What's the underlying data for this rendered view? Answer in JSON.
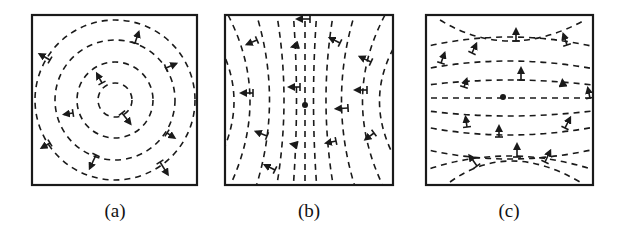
{
  "figure": {
    "colors": {
      "stroke": "#1a1a1a",
      "background": "#ffffff"
    },
    "panels": [
      {
        "id": "a",
        "label": "(a)",
        "pattern": "concentric-circles",
        "box": {
          "x": 32,
          "y": 15,
          "w": 165,
          "h": 170
        },
        "center": [
          115,
          100
        ],
        "circle_radii": [
          17,
          38,
          60,
          80
        ],
        "arrows": [
          {
            "from": [
              102,
              83
            ],
            "to": [
              95,
              70
            ]
          },
          {
            "from": [
              122,
              113
            ],
            "to": [
              133,
              127
            ]
          },
          {
            "from": [
              73,
              113
            ],
            "to": [
              60,
              115
            ]
          },
          {
            "from": [
              96,
              155
            ],
            "to": [
              88,
              172
            ]
          },
          {
            "from": [
              167,
              133
            ],
            "to": [
              178,
              140
            ]
          },
          {
            "from": [
              166,
              68
            ],
            "to": [
              180,
              62
            ]
          },
          {
            "from": [
              135,
              43
            ],
            "to": [
              140,
              28
            ]
          },
          {
            "from": [
              50,
              60
            ],
            "to": [
              36,
              52
            ]
          },
          {
            "from": [
              50,
              143
            ],
            "to": [
              38,
              150
            ]
          },
          {
            "from": [
              160,
              162
            ],
            "to": [
              170,
              178
            ]
          }
        ]
      },
      {
        "id": "b",
        "label": "(b)",
        "pattern": "vertical-hyperbolic",
        "box": {
          "x": 225,
          "y": 15,
          "w": 168,
          "h": 170
        },
        "center": [
          305,
          105
        ],
        "arrows": [
          {
            "from": [
              310,
              19
            ],
            "to": [
              293,
              19
            ]
          },
          {
            "from": [
              257,
              40
            ],
            "to": [
              243,
              46
            ]
          },
          {
            "from": [
              298,
              45
            ],
            "to": [
              288,
              48
            ]
          },
          {
            "from": [
              340,
              43
            ],
            "to": [
              326,
              36
            ]
          },
          {
            "from": [
              371,
              62
            ],
            "to": [
              356,
              55
            ]
          },
          {
            "from": [
              253,
              93
            ],
            "to": [
              237,
              93
            ]
          },
          {
            "from": [
              300,
              87
            ],
            "to": [
              285,
              87
            ]
          },
          {
            "from": [
              367,
              90
            ],
            "to": [
              351,
              90
            ]
          },
          {
            "from": [
              348,
              108
            ],
            "to": [
              332,
              109
            ]
          },
          {
            "from": [
              267,
              136
            ],
            "to": [
              252,
              130
            ]
          },
          {
            "from": [
              297,
              145
            ],
            "to": [
              287,
              143
            ]
          },
          {
            "from": [
              336,
              141
            ],
            "to": [
              322,
              144
            ]
          },
          {
            "from": [
              374,
              133
            ],
            "to": [
              362,
              142
            ]
          },
          {
            "from": [
              275,
              170
            ],
            "to": [
              261,
              163
            ]
          }
        ],
        "center_dot": [
          305,
          105
        ]
      },
      {
        "id": "c",
        "label": "(c)",
        "pattern": "horizontal-hyperbolic",
        "box": {
          "x": 426,
          "y": 15,
          "w": 167,
          "h": 170
        },
        "center": [
          503,
          98
        ],
        "arrows": [
          {
            "from": [
              516,
              41
            ],
            "to": [
              516,
              25
            ]
          },
          {
            "from": [
              567,
              45
            ],
            "to": [
              562,
              30
            ]
          },
          {
            "from": [
              472,
              53
            ],
            "to": [
              478,
              40
            ]
          },
          {
            "from": [
              441,
              63
            ],
            "to": [
              446,
              49
            ]
          },
          {
            "from": [
              521,
              80
            ],
            "to": [
              521,
              64
            ]
          },
          {
            "from": [
              464,
              87
            ],
            "to": [
              468,
              75
            ]
          },
          {
            "from": [
              563,
              86
            ],
            "to": [
              562,
              76
            ]
          },
          {
            "from": [
              590,
              98
            ],
            "to": [
              587,
              84
            ]
          },
          {
            "from": [
              467,
              127
            ],
            "to": [
              465,
              113
            ]
          },
          {
            "from": [
              499,
              137
            ],
            "to": [
              499,
              122
            ]
          },
          {
            "from": [
              565,
              128
            ],
            "to": [
              572,
              114
            ]
          },
          {
            "from": [
              517,
              157
            ],
            "to": [
              517,
              140
            ]
          },
          {
            "from": [
              545,
              162
            ],
            "to": [
              552,
              147
            ]
          },
          {
            "from": [
              477,
              166
            ],
            "to": [
              467,
              152
            ]
          }
        ],
        "center_dot": [
          503,
          97
        ]
      }
    ]
  }
}
